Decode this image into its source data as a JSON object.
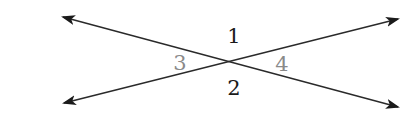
{
  "diagram": {
    "colors": {
      "line": "#2a2a2a",
      "label_dark": "#1a1a1a",
      "label_gray": "#8a8a8a",
      "background": "#ffffff"
    },
    "intersection": {
      "x": 230,
      "y": 62
    },
    "lines": [
      {
        "id": "line-a",
        "from": {
          "x": 63,
          "y": 17
        },
        "to": {
          "x": 398,
          "y": 107
        },
        "arrows": "both"
      },
      {
        "id": "line-b",
        "from": {
          "x": 64,
          "y": 103
        },
        "to": {
          "x": 398,
          "y": 19
        },
        "arrows": "both"
      }
    ],
    "angle_labels": [
      {
        "id": "angle-1",
        "text": "1",
        "x": 234,
        "y": 43,
        "color": "dark"
      },
      {
        "id": "angle-2",
        "text": "2",
        "x": 234,
        "y": 95,
        "color": "dark"
      },
      {
        "id": "angle-3",
        "text": "3",
        "x": 180,
        "y": 70,
        "color": "gray"
      },
      {
        "id": "angle-4",
        "text": "4",
        "x": 282,
        "y": 71,
        "color": "gray"
      }
    ]
  }
}
